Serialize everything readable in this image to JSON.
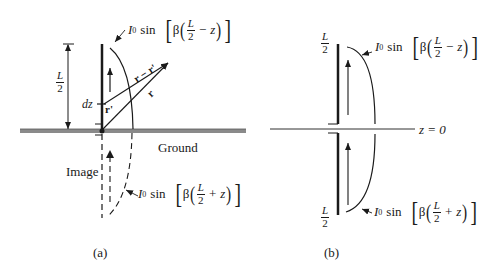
{
  "figure": {
    "panel_a": {
      "caption": "(a)",
      "ground_label": "Ground",
      "image_label": "Image",
      "dimension_label": {
        "num": "L",
        "den": "2"
      },
      "dz_label": "dz",
      "vector_labels": {
        "r_prime": "r'",
        "r": "r",
        "r_minus_r_prime": "r − r'"
      },
      "current_upper": {
        "I": "I",
        "sub": "0",
        "fn": "sin",
        "beta": "β",
        "num": "L",
        "den": "2",
        "op": "−",
        "var": "z"
      },
      "current_lower": {
        "I": "I",
        "sub": "0",
        "fn": "sin",
        "beta": "β",
        "num": "L",
        "den": "2",
        "op": "+",
        "var": "z"
      }
    },
    "panel_b": {
      "caption": "(b)",
      "axis_label": "z = 0",
      "top_label": {
        "num": "L",
        "den": "2"
      },
      "bottom_label": {
        "num": "L",
        "den": "2"
      },
      "current_upper": {
        "I": "I",
        "sub": "0",
        "fn": "sin",
        "beta": "β",
        "num": "L",
        "den": "2",
        "op": "−",
        "var": "z"
      },
      "current_lower": {
        "I": "I",
        "sub": "0",
        "fn": "sin",
        "beta": "β",
        "num": "L",
        "den": "2",
        "op": "+",
        "var": "z"
      }
    },
    "colors": {
      "ink": "#1a1a1a",
      "ground": "#8a8a8a"
    }
  }
}
